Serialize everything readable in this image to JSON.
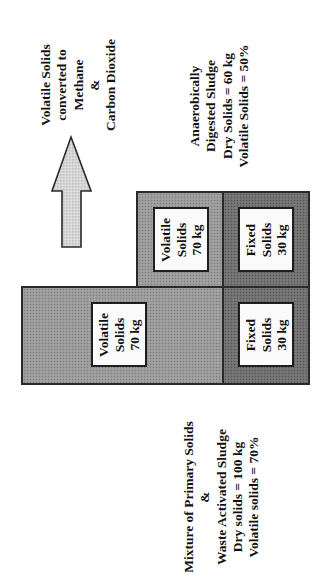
{
  "diagram": {
    "orientation": "rotated 90deg counter-clockwise",
    "colors": {
      "volatile_fill": "#9a9a9a",
      "fixed_fill": "#707070",
      "arrow_fill": "#d6d6d6",
      "outline": "#2a2a2a",
      "inner_box_fill": "#fafafa"
    },
    "output_label": {
      "lines": [
        "Volatile Solids",
        "converted to",
        "Methane",
        "&",
        "Carbon Dioxide"
      ]
    },
    "digested_label": {
      "lines": [
        "Anaerobically",
        "Digested Sludge",
        "Dry Solids = 60 kg",
        "Volatile Solids = 50%"
      ]
    },
    "feed_label": {
      "lines": [
        "Mixture of Primary Solids",
        "&",
        "Waste Activated Sludge",
        "Dry solids = 100 kg",
        "Volatile solids = 70%"
      ]
    },
    "digested_sludge_blocks": {
      "volatile": {
        "lines": [
          "Volatile",
          "Solids",
          "70 kg"
        ]
      },
      "fixed": {
        "lines": [
          "Fixed",
          "Solids",
          "30 kg"
        ]
      }
    },
    "feed_sludge_blocks": {
      "volatile": {
        "lines": [
          "Volatile",
          "Solids",
          "70 kg"
        ]
      },
      "fixed": {
        "lines": [
          "Fixed",
          "Solids",
          "30 kg"
        ]
      }
    },
    "arrow": {
      "direction": "up",
      "meaning": "volatile solids leaving as gas"
    }
  }
}
